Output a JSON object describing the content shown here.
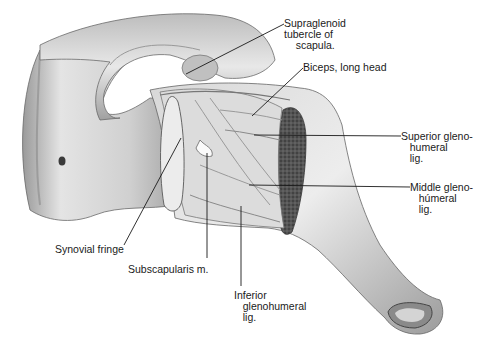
{
  "diagram": {
    "colors": {
      "background": "#ffffff",
      "ink": "#1a1a1a",
      "bone_light": "#ececec",
      "bone_mid": "#c8c8c8",
      "bone_dark": "#8a8a8a",
      "cartilage_dark": "#4a4a4a"
    }
  },
  "labels": [
    {
      "id": "supraglenoid",
      "text": "Supraglenoid\ntubercle of\n    scapula.",
      "x": 284,
      "y": 18,
      "line": [
        284,
        24,
        186,
        74
      ]
    },
    {
      "id": "biceps",
      "text": "Biceps, long head",
      "x": 303,
      "y": 62,
      "line": [
        303,
        68,
        252,
        116
      ]
    },
    {
      "id": "superior_gh",
      "text": "Superior gleno-\n   humeral\n   lig.",
      "x": 401,
      "y": 131,
      "line": [
        401,
        136,
        254,
        135
      ]
    },
    {
      "id": "middle_gh",
      "text": "Middle gleno-\n   húmeral\n   lig.",
      "x": 410,
      "y": 182,
      "line": [
        410,
        187,
        249,
        185
      ]
    },
    {
      "id": "synovial_fringe",
      "text": "Synovial fringe",
      "x": 55,
      "y": 244,
      "line": [
        124,
        245,
        181,
        138
      ]
    },
    {
      "id": "subscapularis",
      "text": "Subscapularis m.",
      "x": 128,
      "y": 264,
      "line": [
        207,
        258,
        207,
        153
      ]
    },
    {
      "id": "inferior_gh",
      "text": "Inferior\n   glenohumeral\n   lig.",
      "x": 234,
      "y": 290,
      "line": [
        241,
        286,
        241,
        206
      ]
    }
  ]
}
